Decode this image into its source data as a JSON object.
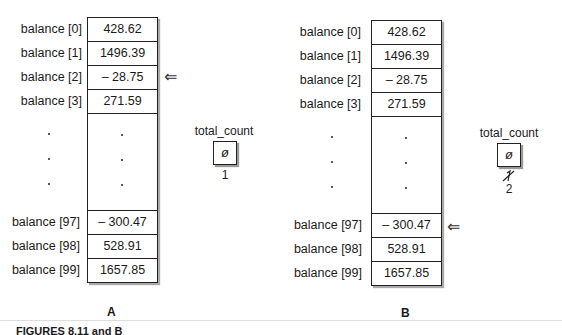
{
  "panels": [
    {
      "letter": "A",
      "array": [
        {
          "label": "balance [0]",
          "value": "428.62"
        },
        {
          "label": "balance [1]",
          "value": "1496.39"
        },
        {
          "label": "balance [2]",
          "value": "– 28.75"
        },
        {
          "label": "balance [3]",
          "value": "271.59"
        },
        {
          "label": "balance [97]",
          "value": "– 300.47"
        },
        {
          "label": "balance [98]",
          "value": "528.91"
        },
        {
          "label": "balance [99]",
          "value": "1657.85"
        }
      ],
      "pointer_row": "balance [2]",
      "pointer_icon": "⇐",
      "variable": {
        "name": "total_count",
        "box_value": "ø",
        "value_below": "1",
        "struck_value": ""
      }
    },
    {
      "letter": "B",
      "array": [
        {
          "label": "balance [0]",
          "value": "428.62"
        },
        {
          "label": "balance [1]",
          "value": "1496.39"
        },
        {
          "label": "balance [2]",
          "value": "– 28.75"
        },
        {
          "label": "balance [3]",
          "value": "271.59"
        },
        {
          "label": "balance [97]",
          "value": "– 300.47"
        },
        {
          "label": "balance [98]",
          "value": "528.91"
        },
        {
          "label": "balance [99]",
          "value": "1657.85"
        }
      ],
      "pointer_row": "balance [97]",
      "pointer_icon": "⇐",
      "variable": {
        "name": "total_count",
        "box_value": "ø",
        "value_below": "2",
        "struck_value": "̸1"
      }
    }
  ],
  "caption": "FIGURES 8.11 and B"
}
